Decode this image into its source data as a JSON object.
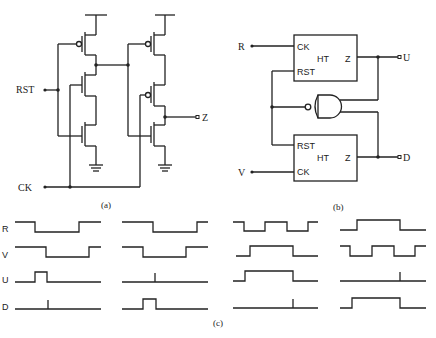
{
  "figure_a": {
    "caption": "(a)",
    "labels": {
      "rst": "RST",
      "ck": "CK",
      "z": "Z"
    },
    "description": "CMOS transistor-level circuit with two stages; RST and CK inputs, output Z"
  },
  "figure_b": {
    "caption": "(b)",
    "top_block": {
      "name": "HT",
      "ck": "CK",
      "rst": "RST",
      "out": "Z"
    },
    "bottom_block": {
      "name": "HT",
      "ck": "CK",
      "rst": "RST",
      "out": "Z"
    },
    "inputs": {
      "r": "R",
      "v": "V"
    },
    "outputs": {
      "u": "U",
      "d": "D"
    },
    "gate": "NAND"
  },
  "figure_c": {
    "caption": "(c)",
    "row_labels": [
      "R",
      "V",
      "U",
      "D"
    ],
    "columns": 4
  }
}
